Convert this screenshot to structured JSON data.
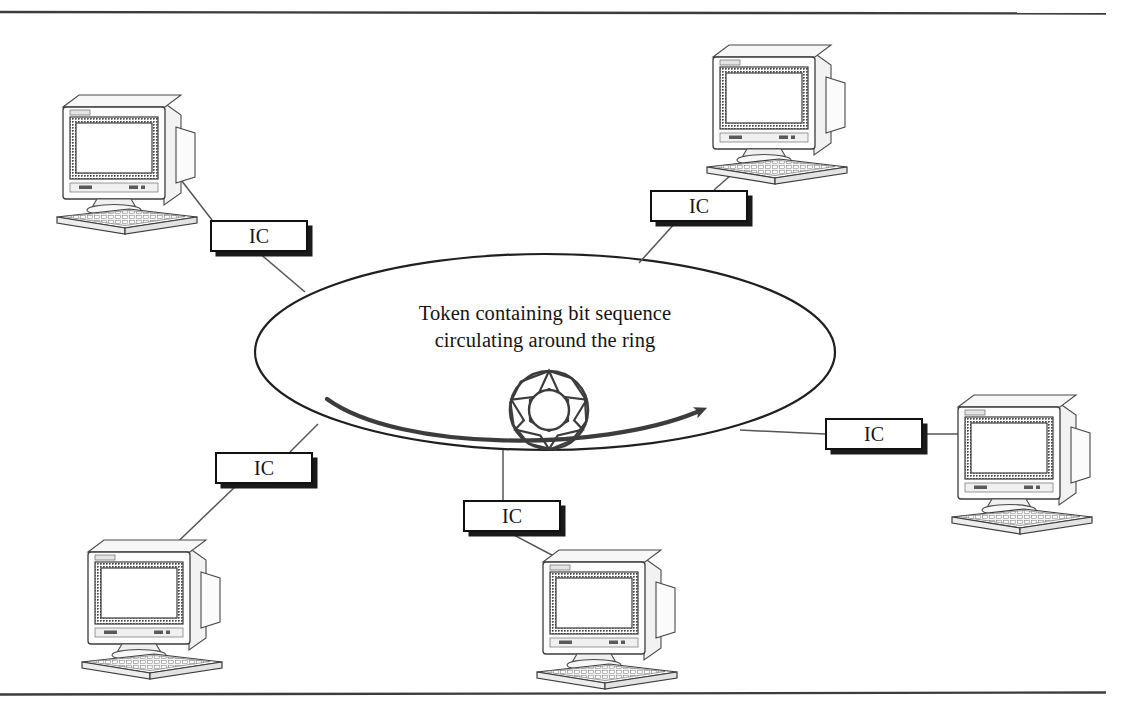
{
  "figure": {
    "caption_text": "Token containing bit sequence\ncirculating around the ring",
    "background_color": "#ffffff",
    "ink_color": "#111111",
    "rule_color": "#3c3c3c",
    "top_rule_label": "top-horizontal-rule",
    "bottom_rule_label": "bottom-horizontal-rule"
  },
  "ring": {
    "shape": "ellipse",
    "center_x": 545,
    "center_y": 352,
    "radius_x": 290,
    "radius_y": 98,
    "direction_arrow_label": "clockwise-token-flow-arrow",
    "token_symbol_name": "token-star-burst",
    "token_points": 9
  },
  "ic_boxes": [
    {
      "id": "ic-top-left",
      "label": "IC",
      "x": 210,
      "y": 220,
      "w": 98,
      "h": 32
    },
    {
      "id": "ic-top-right",
      "label": "IC",
      "x": 650,
      "y": 190,
      "w": 98,
      "h": 32
    },
    {
      "id": "ic-right",
      "label": "IC",
      "x": 825,
      "y": 418,
      "w": 98,
      "h": 32
    },
    {
      "id": "ic-bottom-left",
      "label": "IC",
      "x": 215,
      "y": 452,
      "w": 98,
      "h": 32
    },
    {
      "id": "ic-bottom-mid",
      "label": "IC",
      "x": 463,
      "y": 500,
      "w": 98,
      "h": 32
    }
  ],
  "workstations": [
    {
      "id": "workstation-top-left",
      "label": "computer-workstation",
      "x": 45,
      "y": 85
    },
    {
      "id": "workstation-top-right",
      "label": "computer-workstation",
      "x": 695,
      "y": 35
    },
    {
      "id": "workstation-right",
      "label": "computer-workstation",
      "x": 940,
      "y": 385
    },
    {
      "id": "workstation-bottom-left",
      "label": "computer-workstation",
      "x": 70,
      "y": 530
    },
    {
      "id": "workstation-bottom-mid",
      "label": "computer-workstation",
      "x": 525,
      "y": 540
    }
  ],
  "links": [
    {
      "from": "workstation-top-left",
      "to": "ic-top-left"
    },
    {
      "from": "ic-top-left",
      "to": "ring"
    },
    {
      "from": "workstation-top-right",
      "to": "ic-top-right"
    },
    {
      "from": "ic-top-right",
      "to": "ring"
    },
    {
      "from": "workstation-right",
      "to": "ic-right"
    },
    {
      "from": "ic-right",
      "to": "ring"
    },
    {
      "from": "workstation-bottom-left",
      "to": "ic-bottom-left"
    },
    {
      "from": "ic-bottom-left",
      "to": "ring"
    },
    {
      "from": "workstation-bottom-mid",
      "to": "ic-bottom-mid"
    },
    {
      "from": "ic-bottom-mid",
      "to": "ring"
    }
  ]
}
